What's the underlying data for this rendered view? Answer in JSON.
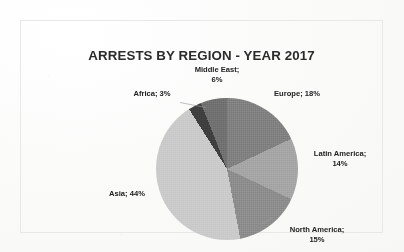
{
  "document": {
    "background_color": "#fbfbfa",
    "frame_border_color": "#e8e8e6"
  },
  "chart_data": {
    "type": "pie",
    "title": "ARRESTS BY REGION - YEAR 2017",
    "xlabel": "",
    "ylabel": "",
    "legend_position": "none",
    "label_format": "{name}; {value}%",
    "start_angle_deg": 0,
    "direction": "clockwise",
    "categories": [
      "Europe",
      "Latin America",
      "North America",
      "Asia",
      "Africa",
      "Middle East"
    ],
    "values": [
      18,
      14,
      15,
      44,
      3,
      6
    ],
    "total": 100,
    "slices": [
      {
        "name": "Europe",
        "value": 18,
        "label_line1": "Europe; 18%",
        "label_line2": "",
        "color": "#7f7f7f"
      },
      {
        "name": "Latin America",
        "value": 14,
        "label_line1": "Latin America;",
        "label_line2": "14%",
        "color": "#a6a6a6"
      },
      {
        "name": "North America",
        "value": 15,
        "label_line1": "North America;",
        "label_line2": "15%",
        "color": "#8c8c8c"
      },
      {
        "name": "Asia",
        "value": 44,
        "label_line1": "Asia; 44%",
        "label_line2": "",
        "color": "#cfcfcf"
      },
      {
        "name": "Africa",
        "value": 3,
        "label_line1": "Africa; 3%",
        "label_line2": "",
        "color": "#3a3a3a"
      },
      {
        "name": "Middle East",
        "value": 6,
        "label_line1": "Middle East;",
        "label_line2": "6%",
        "color": "#6e6e6e"
      }
    ]
  }
}
